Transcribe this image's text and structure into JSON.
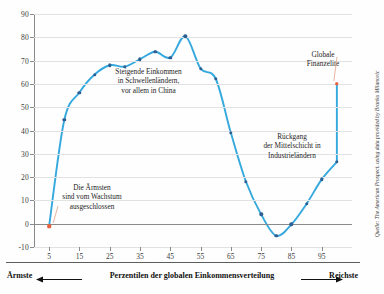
{
  "chart_data": {
    "type": "line",
    "title": "",
    "subtitle": "",
    "xlabel": "Perzentilen der globalen Einkommensverteilung",
    "ylabel": "",
    "xlim": [
      0,
      105
    ],
    "ylim": [
      -10,
      90
    ],
    "grid": true,
    "legend": "none",
    "x_ticks": [
      5,
      15,
      25,
      35,
      45,
      55,
      65,
      75,
      85,
      95
    ],
    "y_ticks": [
      -10,
      0,
      10,
      20,
      30,
      40,
      50,
      60,
      70,
      80,
      90
    ],
    "series": [
      {
        "name": "Relativer Einkommenszuwachs 1988-2008",
        "color": "#35a8dd",
        "marker_color": "#2e5f93",
        "x": [
          5,
          10,
          15,
          20,
          25,
          30,
          35,
          40,
          45,
          50,
          55,
          60,
          65,
          70,
          75,
          80,
          85,
          90,
          95,
          100
        ],
        "values": [
          -1,
          44.5,
          56.3,
          64.0,
          68.0,
          67.4,
          70.6,
          73.8,
          71.3,
          80.4,
          66.6,
          62.2,
          39.0,
          18.0,
          4.0,
          -5.2,
          -0.3,
          8.5,
          19.0,
          26.5
        ]
      },
      {
        "name": "Globale Finanzelite",
        "color": "#e8603c",
        "x": [
          100
        ],
        "values": [
          60.0
        ]
      }
    ],
    "highlight_points": [
      {
        "label": "Die Ärmsten",
        "x": 5,
        "y": -1,
        "color": "#e8603c"
      },
      {
        "label": "Globale Finanzelite",
        "x": 100,
        "y": 60.0,
        "color": "#e8603c"
      }
    ],
    "annotations": [
      {
        "id": "poorest",
        "lines": [
          "Die Ärmsten",
          "sind vom Wachstum",
          "ausgeschlossen"
        ],
        "points_to": {
          "x": 5,
          "y": -1
        }
      },
      {
        "id": "emerging",
        "lines": [
          "Steigende Einkommen",
          "in Schwellenländern,",
          "vor allem in China"
        ],
        "points_to": {
          "x": 40,
          "y": 55
        }
      },
      {
        "id": "middleclass",
        "lines": [
          "Rückgang",
          "der Mittelschicht in",
          "Industrieländern"
        ],
        "points_to": {
          "x": 78,
          "y": 20
        }
      },
      {
        "id": "elite",
        "lines": [
          "Globale",
          "Finanzelite"
        ],
        "points_to": {
          "x": 100,
          "y": 60
        }
      }
    ]
  },
  "axis": {
    "y_tick_labels": [
      "90",
      "80",
      "70",
      "60",
      "50",
      "40",
      "30",
      "20",
      "10",
      "0",
      "-10"
    ],
    "x_tick_labels": [
      "5",
      "15",
      "25",
      "35",
      "45",
      "55",
      "65",
      "75",
      "85",
      "95"
    ]
  },
  "footer": {
    "left_label": "Ärmste",
    "center_label": "Perzentilen der globalen Einkommensverteilung",
    "right_label": "Reichste"
  },
  "source": {
    "text": "Quelle: The American Prospect, using data provided by Branko Milanovic"
  },
  "annotations_text": {
    "poorest": "Die Ärmsten\nsind vom Wachstum\nausgeschlossen",
    "emerging": "Steigende Einkommen\nin Schwellenländern,\nvor allem in China",
    "middleclass": "Rückgang\nder Mittelschicht in\nIndustrieländern",
    "elite": "Globale\nFinanzelite"
  },
  "colors": {
    "line": "#35a8dd",
    "marker": "#2e5f93",
    "accent": "#e8603c",
    "grid": "#e2e2e2",
    "axis": "#8a8a8a"
  }
}
